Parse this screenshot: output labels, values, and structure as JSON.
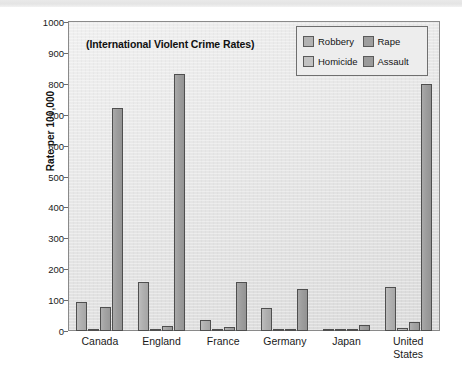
{
  "page": {
    "background_color": "#ffffff",
    "top_band_color": "#e8e8e8"
  },
  "chart_data": {
    "type": "bar",
    "title": "(International Violent Crime Rates)",
    "xlabel": "",
    "ylabel": "Rate per 100,000",
    "ylim": [
      0,
      1000
    ],
    "ytick_step": 100,
    "yticks": [
      1000,
      900,
      800,
      700,
      600,
      500,
      400,
      300,
      200,
      100,
      0
    ],
    "ytick_labels": [
      "1000",
      "900",
      "800",
      "700",
      "600",
      "500",
      "400",
      "300",
      "200",
      "100",
      "0"
    ],
    "grid": false,
    "legend_position": "top-right",
    "categories": [
      "Canada",
      "England",
      "France",
      "Germany",
      "Japan",
      "United States"
    ],
    "category_lines": [
      [
        "Canada"
      ],
      [
        "England"
      ],
      [
        "France"
      ],
      [
        "Germany"
      ],
      [
        "Japan"
      ],
      [
        "United",
        "States"
      ]
    ],
    "series": [
      {
        "name": "Robbery",
        "color": "#b2b2b2",
        "values": [
          95,
          158,
          35,
          73,
          2,
          143
        ]
      },
      {
        "name": "Homicide",
        "color": "#c2c2c2",
        "values": [
          2,
          1,
          1,
          1,
          1,
          9
        ]
      },
      {
        "name": "Rape",
        "color": "#9e9e9e",
        "values": [
          78,
          15,
          13,
          8,
          2,
          28
        ]
      },
      {
        "name": "Assault",
        "color": "#9a9a9a",
        "values": [
          722,
          832,
          160,
          135,
          20,
          801
        ]
      }
    ],
    "legend_entries": [
      {
        "label": "Robbery",
        "color": "#b2b2b2"
      },
      {
        "label": "Rape",
        "color": "#9e9e9e"
      },
      {
        "label": "Homicide",
        "color": "#c2c2c2"
      },
      {
        "label": "Assault",
        "color": "#9a9a9a"
      }
    ]
  }
}
